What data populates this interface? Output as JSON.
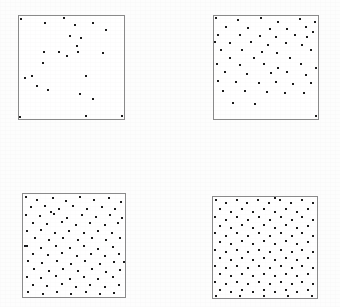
{
  "figure": {
    "background_color": "#fdfdfd",
    "frame_color": "#8a8a8a",
    "point_color": "#1a1a1a",
    "point_size_px": 2,
    "width_px": 340,
    "height_px": 307,
    "panel_count": 4
  },
  "chart_data": {
    "type": "scatter",
    "subtitle": "",
    "xlabel": "",
    "ylabel": "",
    "grid": false,
    "legend": "none",
    "axes_visible": false,
    "tick_labels": [],
    "xlim": [
      0,
      1
    ],
    "ylim": [
      0,
      1
    ],
    "panels": [
      {
        "name": "panel-top-left",
        "index": 1,
        "n_points": 25,
        "frame": {
          "x": 18,
          "y": 15,
          "w": 107,
          "h": 105
        },
        "points": [
          [
            0.015,
            0.025
          ],
          [
            0.245,
            0.065
          ],
          [
            0.425,
            0.02
          ],
          [
            0.535,
            0.085
          ],
          [
            0.7,
            0.068
          ],
          [
            0.83,
            0.135
          ],
          [
            0.485,
            0.195
          ],
          [
            0.59,
            0.21
          ],
          [
            0.555,
            0.29
          ],
          [
            0.56,
            0.345
          ],
          [
            0.235,
            0.345
          ],
          [
            0.385,
            0.345
          ],
          [
            0.455,
            0.39
          ],
          [
            0.8,
            0.36
          ],
          [
            0.23,
            0.46
          ],
          [
            0.125,
            0.58
          ],
          [
            0.06,
            0.6
          ],
          [
            0.175,
            0.68
          ],
          [
            0.275,
            0.715
          ],
          [
            0.64,
            0.58
          ],
          [
            0.585,
            0.76
          ],
          [
            0.705,
            0.81
          ],
          [
            0.64,
            0.975
          ],
          [
            0.985,
            0.975
          ],
          [
            0.01,
            0.985
          ]
        ]
      },
      {
        "name": "panel-top-right",
        "index": 2,
        "n_points": 57,
        "frame": {
          "x": 213,
          "y": 15,
          "w": 106,
          "h": 105
        },
        "points": [
          [
            0.02,
            0.02
          ],
          [
            0.23,
            0.035
          ],
          [
            0.45,
            0.02
          ],
          [
            0.62,
            0.055
          ],
          [
            0.825,
            0.03
          ],
          [
            0.975,
            0.06
          ],
          [
            0.12,
            0.105
          ],
          [
            0.33,
            0.12
          ],
          [
            0.54,
            0.125
          ],
          [
            0.7,
            0.125
          ],
          [
            0.88,
            0.105
          ],
          [
            0.955,
            0.155
          ],
          [
            0.04,
            0.185
          ],
          [
            0.25,
            0.18
          ],
          [
            0.44,
            0.19
          ],
          [
            0.6,
            0.2
          ],
          [
            0.775,
            0.185
          ],
          [
            0.895,
            0.205
          ],
          [
            0.01,
            0.25
          ],
          [
            0.15,
            0.265
          ],
          [
            0.355,
            0.25
          ],
          [
            0.52,
            0.28
          ],
          [
            0.69,
            0.265
          ],
          [
            0.845,
            0.285
          ],
          [
            0.07,
            0.33
          ],
          [
            0.265,
            0.33
          ],
          [
            0.46,
            0.345
          ],
          [
            0.61,
            0.355
          ],
          [
            0.93,
            0.33
          ],
          [
            0.15,
            0.41
          ],
          [
            0.38,
            0.41
          ],
          [
            0.73,
            0.405
          ],
          [
            0.03,
            0.47
          ],
          [
            0.25,
            0.48
          ],
          [
            0.48,
            0.47
          ],
          [
            0.62,
            0.505
          ],
          [
            0.84,
            0.47
          ],
          [
            0.985,
            0.5
          ],
          [
            0.11,
            0.545
          ],
          [
            0.32,
            0.56
          ],
          [
            0.545,
            0.555
          ],
          [
            0.705,
            0.545
          ],
          [
            0.88,
            0.575
          ],
          [
            0.035,
            0.63
          ],
          [
            0.215,
            0.64
          ],
          [
            0.43,
            0.655
          ],
          [
            0.6,
            0.64
          ],
          [
            0.76,
            0.66
          ],
          [
            0.93,
            0.65
          ],
          [
            0.09,
            0.725
          ],
          [
            0.3,
            0.73
          ],
          [
            0.505,
            0.74
          ],
          [
            0.68,
            0.75
          ],
          [
            0.87,
            0.745
          ],
          [
            0.18,
            0.84
          ],
          [
            0.395,
            0.855
          ],
          [
            0.985,
            0.975
          ]
        ]
      },
      {
        "name": "panel-bottom-left",
        "index": 3,
        "n_points": 96,
        "frame": {
          "x": 22,
          "y": 193,
          "w": 104,
          "h": 105
        },
        "points": [
          [
            0.03,
            0.03
          ],
          [
            0.14,
            0.06
          ],
          [
            0.29,
            0.035
          ],
          [
            0.42,
            0.07
          ],
          [
            0.56,
            0.03
          ],
          [
            0.7,
            0.055
          ],
          [
            0.84,
            0.04
          ],
          [
            0.96,
            0.075
          ],
          [
            0.08,
            0.13
          ],
          [
            0.215,
            0.12
          ],
          [
            0.355,
            0.145
          ],
          [
            0.49,
            0.12
          ],
          [
            0.63,
            0.15
          ],
          [
            0.77,
            0.125
          ],
          [
            0.905,
            0.145
          ],
          [
            0.03,
            0.2
          ],
          [
            0.165,
            0.215
          ],
          [
            0.3,
            0.195
          ],
          [
            0.435,
            0.23
          ],
          [
            0.575,
            0.205
          ],
          [
            0.715,
            0.225
          ],
          [
            0.85,
            0.2
          ],
          [
            0.975,
            0.23
          ],
          [
            0.095,
            0.285
          ],
          [
            0.24,
            0.295
          ],
          [
            0.38,
            0.275
          ],
          [
            0.52,
            0.3
          ],
          [
            0.66,
            0.28
          ],
          [
            0.8,
            0.305
          ],
          [
            0.93,
            0.285
          ],
          [
            0.04,
            0.36
          ],
          [
            0.175,
            0.35
          ],
          [
            0.315,
            0.375
          ],
          [
            0.455,
            0.355
          ],
          [
            0.595,
            0.38
          ],
          [
            0.735,
            0.355
          ],
          [
            0.875,
            0.375
          ],
          [
            0.115,
            0.43
          ],
          [
            0.255,
            0.445
          ],
          [
            0.395,
            0.425
          ],
          [
            0.535,
            0.45
          ],
          [
            0.675,
            0.43
          ],
          [
            0.815,
            0.45
          ],
          [
            0.955,
            0.43
          ],
          [
            0.035,
            0.505
          ],
          [
            0.18,
            0.52
          ],
          [
            0.32,
            0.5
          ],
          [
            0.46,
            0.525
          ],
          [
            0.6,
            0.505
          ],
          [
            0.74,
            0.53
          ],
          [
            0.88,
            0.51
          ],
          [
            0.1,
            0.58
          ],
          [
            0.245,
            0.595
          ],
          [
            0.385,
            0.575
          ],
          [
            0.525,
            0.6
          ],
          [
            0.665,
            0.58
          ],
          [
            0.805,
            0.6
          ],
          [
            0.945,
            0.58
          ],
          [
            0.045,
            0.655
          ],
          [
            0.19,
            0.67
          ],
          [
            0.33,
            0.65
          ],
          [
            0.47,
            0.675
          ],
          [
            0.61,
            0.655
          ],
          [
            0.75,
            0.68
          ],
          [
            0.89,
            0.66
          ],
          [
            0.11,
            0.73
          ],
          [
            0.255,
            0.745
          ],
          [
            0.395,
            0.725
          ],
          [
            0.535,
            0.75
          ],
          [
            0.675,
            0.73
          ],
          [
            0.815,
            0.755
          ],
          [
            0.955,
            0.735
          ],
          [
            0.035,
            0.805
          ],
          [
            0.18,
            0.82
          ],
          [
            0.32,
            0.8
          ],
          [
            0.46,
            0.825
          ],
          [
            0.6,
            0.805
          ],
          [
            0.74,
            0.83
          ],
          [
            0.88,
            0.81
          ],
          [
            0.095,
            0.88
          ],
          [
            0.24,
            0.895
          ],
          [
            0.38,
            0.875
          ],
          [
            0.52,
            0.9
          ],
          [
            0.66,
            0.88
          ],
          [
            0.8,
            0.905
          ],
          [
            0.94,
            0.885
          ],
          [
            0.05,
            0.955
          ],
          [
            0.195,
            0.97
          ],
          [
            0.335,
            0.95
          ],
          [
            0.475,
            0.975
          ],
          [
            0.615,
            0.955
          ],
          [
            0.755,
            0.975
          ],
          [
            0.895,
            0.96
          ],
          [
            0.015,
            0.5
          ],
          [
            0.99,
            0.66
          ],
          [
            0.27,
            0.17
          ]
        ]
      },
      {
        "name": "panel-bottom-right",
        "index": 4,
        "n_points": 120,
        "frame": {
          "x": 212,
          "y": 196,
          "w": 106,
          "h": 103
        },
        "points": [
          [
            0.025,
            0.03
          ],
          [
            0.125,
            0.06
          ],
          [
            0.23,
            0.03
          ],
          [
            0.33,
            0.055
          ],
          [
            0.435,
            0.03
          ],
          [
            0.54,
            0.06
          ],
          [
            0.645,
            0.03
          ],
          [
            0.75,
            0.055
          ],
          [
            0.855,
            0.03
          ],
          [
            0.96,
            0.06
          ],
          [
            0.07,
            0.12
          ],
          [
            0.175,
            0.145
          ],
          [
            0.28,
            0.115
          ],
          [
            0.385,
            0.145
          ],
          [
            0.49,
            0.115
          ],
          [
            0.595,
            0.145
          ],
          [
            0.7,
            0.115
          ],
          [
            0.805,
            0.145
          ],
          [
            0.91,
            0.12
          ],
          [
            0.02,
            0.2
          ],
          [
            0.125,
            0.225
          ],
          [
            0.23,
            0.195
          ],
          [
            0.335,
            0.225
          ],
          [
            0.44,
            0.2
          ],
          [
            0.545,
            0.225
          ],
          [
            0.65,
            0.195
          ],
          [
            0.755,
            0.225
          ],
          [
            0.86,
            0.2
          ],
          [
            0.965,
            0.225
          ],
          [
            0.07,
            0.285
          ],
          [
            0.175,
            0.305
          ],
          [
            0.28,
            0.28
          ],
          [
            0.385,
            0.305
          ],
          [
            0.49,
            0.28
          ],
          [
            0.595,
            0.305
          ],
          [
            0.7,
            0.28
          ],
          [
            0.805,
            0.305
          ],
          [
            0.91,
            0.285
          ],
          [
            0.02,
            0.36
          ],
          [
            0.125,
            0.385
          ],
          [
            0.23,
            0.36
          ],
          [
            0.335,
            0.385
          ],
          [
            0.44,
            0.36
          ],
          [
            0.545,
            0.385
          ],
          [
            0.65,
            0.36
          ],
          [
            0.755,
            0.385
          ],
          [
            0.86,
            0.36
          ],
          [
            0.965,
            0.385
          ],
          [
            0.07,
            0.445
          ],
          [
            0.175,
            0.465
          ],
          [
            0.28,
            0.44
          ],
          [
            0.385,
            0.465
          ],
          [
            0.49,
            0.44
          ],
          [
            0.595,
            0.465
          ],
          [
            0.7,
            0.44
          ],
          [
            0.805,
            0.465
          ],
          [
            0.91,
            0.445
          ],
          [
            0.02,
            0.52
          ],
          [
            0.125,
            0.545
          ],
          [
            0.23,
            0.52
          ],
          [
            0.335,
            0.545
          ],
          [
            0.44,
            0.52
          ],
          [
            0.545,
            0.545
          ],
          [
            0.65,
            0.52
          ],
          [
            0.755,
            0.545
          ],
          [
            0.86,
            0.52
          ],
          [
            0.965,
            0.545
          ],
          [
            0.07,
            0.605
          ],
          [
            0.175,
            0.625
          ],
          [
            0.28,
            0.6
          ],
          [
            0.385,
            0.625
          ],
          [
            0.49,
            0.6
          ],
          [
            0.595,
            0.625
          ],
          [
            0.7,
            0.6
          ],
          [
            0.805,
            0.625
          ],
          [
            0.91,
            0.605
          ],
          [
            0.02,
            0.68
          ],
          [
            0.125,
            0.705
          ],
          [
            0.23,
            0.68
          ],
          [
            0.335,
            0.705
          ],
          [
            0.44,
            0.68
          ],
          [
            0.545,
            0.705
          ],
          [
            0.65,
            0.68
          ],
          [
            0.755,
            0.705
          ],
          [
            0.86,
            0.68
          ],
          [
            0.965,
            0.705
          ],
          [
            0.07,
            0.765
          ],
          [
            0.175,
            0.785
          ],
          [
            0.28,
            0.76
          ],
          [
            0.385,
            0.785
          ],
          [
            0.49,
            0.76
          ],
          [
            0.595,
            0.785
          ],
          [
            0.7,
            0.76
          ],
          [
            0.805,
            0.785
          ],
          [
            0.91,
            0.765
          ],
          [
            0.02,
            0.84
          ],
          [
            0.125,
            0.865
          ],
          [
            0.23,
            0.84
          ],
          [
            0.335,
            0.865
          ],
          [
            0.44,
            0.84
          ],
          [
            0.545,
            0.865
          ],
          [
            0.65,
            0.84
          ],
          [
            0.755,
            0.865
          ],
          [
            0.86,
            0.84
          ],
          [
            0.965,
            0.865
          ],
          [
            0.07,
            0.925
          ],
          [
            0.175,
            0.945
          ],
          [
            0.28,
            0.92
          ],
          [
            0.385,
            0.945
          ],
          [
            0.49,
            0.92
          ],
          [
            0.595,
            0.945
          ],
          [
            0.7,
            0.92
          ],
          [
            0.805,
            0.945
          ],
          [
            0.91,
            0.925
          ],
          [
            0.03,
            0.985
          ],
          [
            0.26,
            0.98
          ],
          [
            0.49,
            0.985
          ],
          [
            0.72,
            0.98
          ],
          [
            0.95,
            0.985
          ],
          [
            0.6,
            0.01
          ]
        ]
      }
    ]
  }
}
